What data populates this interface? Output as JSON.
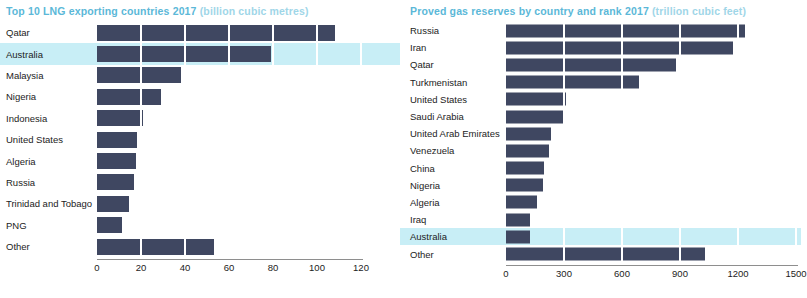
{
  "charts": [
    {
      "id": "lng-exporters",
      "title_main": "Top 10 LNG exporting countries 2017",
      "title_unit": "(billion cubic metres)",
      "chart_data": {
        "type": "bar",
        "orientation": "horizontal",
        "title": "Top 10 LNG exporting countries 2017 (billion cubic metres)",
        "xlabel": "billion cubic metres",
        "ylabel": "",
        "xlim": [
          0,
          120
        ],
        "ticks": [
          0,
          20,
          40,
          60,
          80,
          100,
          120
        ],
        "tick_labels": [
          "0",
          "20",
          "40",
          "60",
          "80",
          "100",
          "120"
        ],
        "grid": true,
        "legend": "none",
        "highlight": "Australia",
        "categories": [
          "Qatar",
          "Australia",
          "Malaysia",
          "Nigeria",
          "Indonesia",
          "United States",
          "Algeria",
          "Russia",
          "Trinidad and Tobago",
          "PNG",
          "Other"
        ],
        "values": [
          108,
          79,
          38,
          29,
          21,
          18,
          17.5,
          17,
          14.5,
          11.5,
          53
        ]
      }
    },
    {
      "id": "proved-gas-reserves",
      "title_main": "Proved gas reserves by country and rank 2017",
      "title_unit": "(trillion cubic feet)",
      "chart_data": {
        "type": "bar",
        "orientation": "horizontal",
        "title": "Proved gas reserves by country and rank 2017 (trillion cubic feet)",
        "xlabel": "trillion cubic feet",
        "ylabel": "",
        "xlim": [
          0,
          1500
        ],
        "ticks": [
          0,
          300,
          600,
          900,
          1200,
          1500
        ],
        "tick_labels": [
          "0",
          "300",
          "600",
          "900",
          "1200",
          "1500"
        ],
        "grid": true,
        "legend": "none",
        "highlight": "Australia",
        "categories": [
          "Russia",
          "Iran",
          "Qatar",
          "Turkmenistan",
          "United States",
          "Saudi Arabia",
          "United Arab Emirates",
          "Venezuela",
          "China",
          "Nigeria",
          "Algeria",
          "Iraq",
          "Australia",
          "Other"
        ],
        "values": [
          1235,
          1175,
          880,
          690,
          310,
          300,
          233,
          224,
          195,
          190,
          160,
          125,
          122,
          1030
        ]
      }
    }
  ]
}
